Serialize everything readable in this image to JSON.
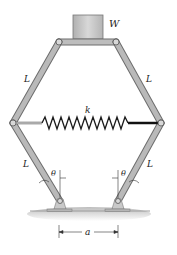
{
  "figure": {
    "labels": {
      "weight": "W",
      "spring": "k",
      "link_upper_left": "L",
      "link_upper_right": "L",
      "link_lower_left": "L",
      "link_lower_right": "L",
      "angle_left": "θ",
      "angle_right": "θ",
      "base_distance": "a"
    },
    "colors": {
      "link": "#b9b9b9",
      "link_edge": "#6d6d6d",
      "block": "#c6c6c6",
      "spring": "#1a1a1a",
      "ground": "#cfcfcf"
    }
  }
}
